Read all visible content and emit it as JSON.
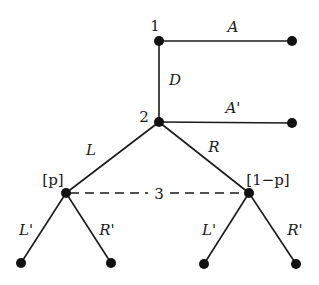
{
  "diagram": {
    "type": "extensive-form game tree",
    "players": {
      "player1": "1",
      "player2": "2",
      "player3": "3"
    },
    "actions": {
      "player1_across": "A",
      "player1_down": "D",
      "player2_across": "A'",
      "player2_left": "L",
      "player2_right": "R",
      "player3_left_at_left_node": "L'",
      "player3_right_at_left_node": "R'",
      "player3_left_at_right_node": "L'",
      "player3_right_at_right_node": "R'"
    },
    "beliefs": {
      "left_node": "[p]",
      "right_node": "[1−p]"
    },
    "information_set": {
      "label": "3",
      "style": "dashed"
    },
    "colors": {
      "line": "#1a1a1a",
      "node": "#111111",
      "background": "#ffffff"
    }
  }
}
